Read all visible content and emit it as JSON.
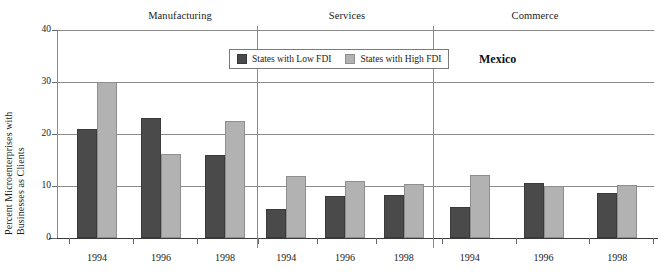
{
  "chart_data": {
    "type": "bar",
    "title": "",
    "country": "Mexico",
    "xlabel": "",
    "ylabel": "Percent Microenterprises with Businesses as Clients",
    "ylabel_line1": "Percent Microenterprises with",
    "ylabel_line2": "Businesses as Clients",
    "ylim": [
      0,
      40
    ],
    "yticks": [
      0,
      10,
      20,
      30,
      40
    ],
    "grid": true,
    "legend_position": "top-center",
    "categories": [
      "1994",
      "1996",
      "1998"
    ],
    "panels": [
      {
        "name": "Manufacturing",
        "categories": [
          "1994",
          "1996",
          "1998"
        ],
        "series": [
          {
            "name": "States with Low FDI",
            "values": [
              21.0,
              23.0,
              16.0
            ]
          },
          {
            "name": "States with High FDI",
            "values": [
              30.0,
              16.2,
              22.5
            ]
          }
        ]
      },
      {
        "name": "Services",
        "categories": [
          "1994",
          "1996",
          "1998"
        ],
        "series": [
          {
            "name": "States with Low FDI",
            "values": [
              5.6,
              8.1,
              8.3
            ]
          },
          {
            "name": "States with High FDI",
            "values": [
              11.9,
              10.9,
              10.4
            ]
          }
        ]
      },
      {
        "name": "Commerce",
        "categories": [
          "1994",
          "1996",
          "1998"
        ],
        "series": [
          {
            "name": "States with Low FDI",
            "values": [
              5.9,
              10.6,
              8.6
            ]
          },
          {
            "name": "States with High FDI",
            "values": [
              12.1,
              10.0,
              10.1
            ]
          }
        ]
      }
    ],
    "series_names": [
      "States with Low FDI",
      "States with High FDI"
    ],
    "colors": {
      "low_fdi": "#4a4a4a",
      "high_fdi": "#b2b2b2",
      "axis": "#8a8a8a",
      "text": "#1a1a1a"
    }
  },
  "legend": {
    "entries": [
      {
        "label": "States with Low FDI",
        "key": "low"
      },
      {
        "label": "States with High FDI",
        "key": "high"
      }
    ]
  },
  "panel_titles": [
    "Manufacturing",
    "Services",
    "Commerce"
  ],
  "ytick_labels": [
    "0",
    "10",
    "20",
    "30",
    "40"
  ],
  "xtick_labels": [
    "1994",
    "1996",
    "1998",
    "1994",
    "1996",
    "1998",
    "1994",
    "1996",
    "1998"
  ],
  "country_label": "Mexico"
}
